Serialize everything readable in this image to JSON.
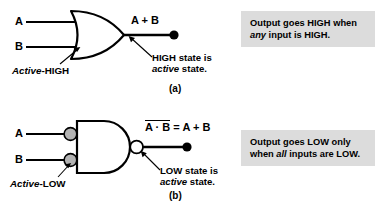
{
  "figure": {
    "background": "#ffffff",
    "line_color": "#000000",
    "bubble_fill_input": "#b3b3b3",
    "bubble_fill_output": "#ffffff",
    "infobox_bg": "#dcdcdc"
  },
  "panel_a": {
    "gate_type": "OR",
    "inputs": [
      {
        "label": "A"
      },
      {
        "label": "B"
      }
    ],
    "output_expression": "A + B",
    "active_label_italic": "Active",
    "active_label_plain": "-HIGH",
    "callout_line1": "HIGH state is",
    "callout_line2_italic": "active",
    "callout_line2_plain": " state.",
    "figure_label": "(a)",
    "infobox_line1": "Output goes HIGH when",
    "infobox_line2_italic": "any",
    "infobox_line2_plain": " input is HIGH."
  },
  "panel_b": {
    "gate_type": "NAND",
    "inputs": [
      {
        "label": "A"
      },
      {
        "label": "B"
      }
    ],
    "output_expression_overlined": "A · B",
    "output_expression_rest": " = A + B",
    "active_label_italic": "Active",
    "active_label_plain": "-LOW",
    "callout_line1": "LOW state is",
    "callout_line2_italic": "active",
    "callout_line2_plain": " state.",
    "figure_label": "(b)",
    "infobox_line1": "Output goes LOW only",
    "infobox_line2_plain_a": "when ",
    "infobox_line2_italic": "all",
    "infobox_line2_plain_b": " inputs are LOW."
  }
}
